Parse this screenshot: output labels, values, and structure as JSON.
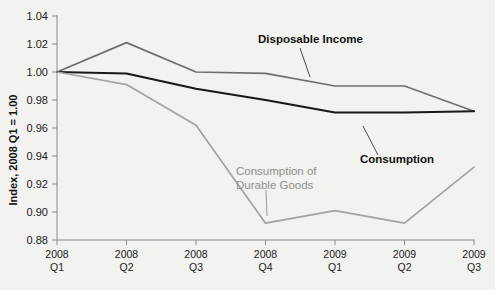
{
  "chart_data": {
    "type": "line",
    "title": "",
    "subtitle": "",
    "xlabel": "",
    "ylabel": "Index, 2008 Q1 = 1.00",
    "ylim": [
      0.88,
      1.04
    ],
    "ytick_step": 0.02,
    "ytick_labels": [
      "0.88",
      "0.90",
      "0.92",
      "0.94",
      "0.96",
      "0.98",
      "1.00",
      "1.02",
      "1.04"
    ],
    "ytick_values": [
      0.88,
      0.9,
      0.92,
      0.94,
      0.96,
      0.98,
      1.0,
      1.02,
      1.04
    ],
    "categories": [
      "2008 Q1",
      "2008 Q2",
      "2008 Q3",
      "2008 Q4",
      "2009 Q1",
      "2009 Q2",
      "2009 Q3"
    ],
    "xtick_labels": [
      {
        "line1": "2008",
        "line2": "Q1"
      },
      {
        "line1": "2008",
        "line2": "Q2"
      },
      {
        "line1": "2008",
        "line2": "Q3"
      },
      {
        "line1": "2008",
        "line2": "Q4"
      },
      {
        "line1": "2009",
        "line2": "Q1"
      },
      {
        "line1": "2009",
        "line2": "Q2"
      },
      {
        "line1": "2009",
        "line2": "Q3"
      }
    ],
    "grid": false,
    "legend": "none",
    "series": [
      {
        "name": "Disposable Income",
        "color": "#6e6e6e",
        "width": 1.7,
        "values": [
          1.0,
          1.021,
          1.0,
          0.999,
          0.99,
          0.99,
          0.972
        ]
      },
      {
        "name": "Consumption",
        "color": "#181818",
        "width": 2.0,
        "values": [
          1.0,
          0.999,
          0.988,
          0.98,
          0.971,
          0.971,
          0.972
        ]
      },
      {
        "name": "Consumption of Durable Goods",
        "color": "#a2a2a2",
        "width": 1.7,
        "values": [
          1.0,
          0.991,
          0.962,
          0.892,
          0.901,
          0.892,
          0.932
        ]
      }
    ],
    "annotations": [
      {
        "text_line1": "Disposable Income",
        "text_line2": "",
        "style": "bold-dark",
        "color": "#111111"
      },
      {
        "text_line1": "Consumption",
        "text_line2": "",
        "style": "bold-dark",
        "color": "#111111"
      },
      {
        "text_line1": "Consumption of",
        "text_line2": "Durable Goods",
        "style": "plain-gray",
        "color": "#8e8e8e"
      }
    ]
  },
  "colors": {
    "background": "#f2f2f0",
    "axis": "#8a8a8a",
    "text": "#1a1a1a"
  }
}
